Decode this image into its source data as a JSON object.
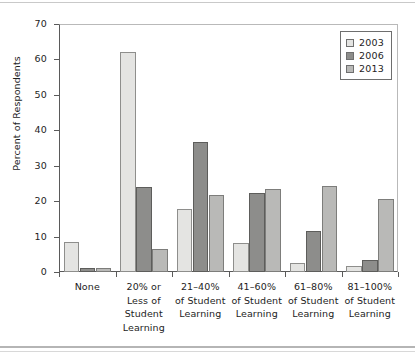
{
  "chart_data": {
    "type": "bar",
    "title": "",
    "subtitle": "",
    "xlabel": "",
    "ylabel": "Percent of Respondents",
    "ylim": [
      0,
      70
    ],
    "yticks": [
      0,
      10,
      20,
      30,
      40,
      50,
      60,
      70
    ],
    "ytick_labels": [
      "0",
      "10",
      "20",
      "30",
      "40",
      "50",
      "60",
      "70"
    ],
    "grid": false,
    "legend_position": "top-right",
    "categories": [
      "None",
      "20% or Less of Student Learning",
      "21–40% of Student Learning",
      "41–60% of Student Learning",
      "61–80% of Student Learning",
      "81–100% of Student Learning"
    ],
    "category_lines": [
      [
        "None"
      ],
      [
        "20% or",
        "Less of",
        "Student",
        "Learning"
      ],
      [
        "21–40%",
        "of Student",
        "Learning"
      ],
      [
        "41–60%",
        "of Student",
        "Learning"
      ],
      [
        "61–80%",
        "of Student",
        "Learning"
      ],
      [
        "81–100%",
        "of Student",
        "Learning"
      ]
    ],
    "series": [
      {
        "name": "2003",
        "color": "#e4e4e2",
        "values": [
          8.5,
          62.0,
          17.7,
          8.2,
          2.5,
          1.7
        ]
      },
      {
        "name": "2006",
        "color": "#8d8d8b",
        "values": [
          1.2,
          24.0,
          36.6,
          22.2,
          11.5,
          3.5
        ]
      },
      {
        "name": "2013",
        "color": "#b9b9b7",
        "values": [
          1.2,
          6.6,
          21.8,
          23.5,
          24.2,
          20.5
        ]
      }
    ]
  },
  "legend": {
    "entries": [
      {
        "label": "2003",
        "color": "#e4e4e2"
      },
      {
        "label": "2006",
        "color": "#8d8d8b"
      },
      {
        "label": "2013",
        "color": "#b9b9b7"
      }
    ]
  },
  "axis": {
    "y_title": "Percent of Respondents"
  }
}
